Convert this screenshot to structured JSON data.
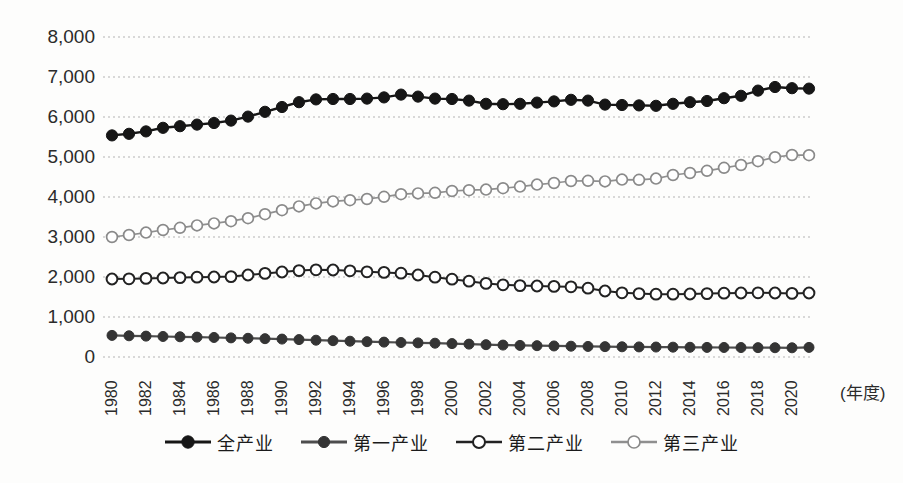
{
  "figure": {
    "background": "#fdfdfc",
    "grid_color": "#b3b3b3",
    "tick_label_color": "#2b2b2b"
  },
  "chart_data": {
    "type": "line",
    "title": "",
    "xlabel": "(年度)",
    "ylabel": "",
    "ylim": [
      0,
      8000
    ],
    "ytick_interval": 1000,
    "ytick_labels": [
      "0",
      "1,000",
      "2,000",
      "3,000",
      "4,000",
      "5,000",
      "6,000",
      "7,000",
      "8,000"
    ],
    "xtick_labels": [
      "1980",
      "1982",
      "1984",
      "1986",
      "1988",
      "1990",
      "1992",
      "1994",
      "1996",
      "1998",
      "2000",
      "2002",
      "2004",
      "2006",
      "2008",
      "2010",
      "2012",
      "2014",
      "2016",
      "2018",
      "2020"
    ],
    "grid": "horizontal-dotted",
    "legend_position": "bottom",
    "x": [
      1980,
      1981,
      1982,
      1983,
      1984,
      1985,
      1986,
      1987,
      1988,
      1989,
      1990,
      1991,
      1992,
      1993,
      1994,
      1995,
      1996,
      1997,
      1998,
      1999,
      2000,
      2001,
      2002,
      2003,
      2004,
      2005,
      2006,
      2007,
      2008,
      2009,
      2010,
      2011,
      2012,
      2013,
      2014,
      2015,
      2016,
      2017,
      2018,
      2019,
      2020,
      2021
    ],
    "series": [
      {
        "name": "全产业",
        "marker": "filled-circle",
        "line_color": "#161616",
        "marker_fill": "#161616",
        "marker_stroke": "#161616",
        "line_width": 2.4,
        "marker_radius": 5.6,
        "values": [
          5540,
          5580,
          5640,
          5730,
          5770,
          5810,
          5850,
          5910,
          6010,
          6130,
          6250,
          6370,
          6440,
          6450,
          6450,
          6460,
          6490,
          6560,
          6510,
          6460,
          6450,
          6410,
          6330,
          6320,
          6330,
          6360,
          6390,
          6430,
          6410,
          6310,
          6300,
          6290,
          6280,
          6330,
          6370,
          6400,
          6470,
          6530,
          6660,
          6750,
          6720,
          6710
        ]
      },
      {
        "name": "第一产业",
        "marker": "filled-circle",
        "line_color": "#4d4d4d",
        "marker_fill": "#343434",
        "marker_stroke": "#343434",
        "line_width": 2.2,
        "marker_radius": 5.0,
        "values": [
          540,
          530,
          522,
          513,
          505,
          497,
          488,
          478,
          468,
          458,
          448,
          435,
          420,
          408,
          395,
          383,
          372,
          362,
          353,
          345,
          335,
          322,
          308,
          298,
          290,
          283,
          276,
          270,
          264,
          259,
          255,
          252,
          249,
          246,
          243,
          240,
          238,
          236,
          234,
          232,
          230,
          240
        ]
      },
      {
        "name": "第二产业",
        "marker": "open-circle",
        "line_color": "#222222",
        "marker_fill": "#ffffff",
        "marker_stroke": "#222222",
        "line_width": 2.0,
        "marker_radius": 5.4,
        "values": [
          1950,
          1955,
          1965,
          1975,
          1985,
          1995,
          2000,
          2010,
          2050,
          2090,
          2125,
          2160,
          2180,
          2175,
          2155,
          2130,
          2115,
          2095,
          2050,
          1995,
          1945,
          1895,
          1840,
          1805,
          1785,
          1775,
          1765,
          1755,
          1720,
          1650,
          1605,
          1585,
          1570,
          1570,
          1575,
          1585,
          1595,
          1600,
          1605,
          1600,
          1590,
          1600
        ]
      },
      {
        "name": "第三产业",
        "marker": "open-circle",
        "line_color": "#8f8f8f",
        "marker_fill": "#ffffff",
        "marker_stroke": "#8a8a8a",
        "line_width": 1.7,
        "marker_radius": 5.4,
        "values": [
          3000,
          3050,
          3110,
          3175,
          3230,
          3290,
          3340,
          3395,
          3470,
          3570,
          3670,
          3765,
          3840,
          3890,
          3920,
          3950,
          4005,
          4070,
          4090,
          4105,
          4150,
          4170,
          4185,
          4220,
          4260,
          4310,
          4350,
          4400,
          4405,
          4390,
          4435,
          4430,
          4460,
          4550,
          4600,
          4655,
          4730,
          4800,
          4895,
          4995,
          5050,
          5045
        ]
      }
    ]
  }
}
